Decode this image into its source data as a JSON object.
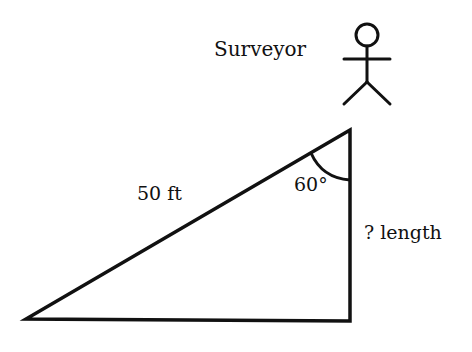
{
  "diagram": {
    "labels": {
      "surveyor": "Surveyor",
      "hypotenuse": "50 ft",
      "angle": "60°",
      "unknown_side": "? length"
    },
    "triangle": {
      "vertices": {
        "apex": [
          350,
          130
        ],
        "bottom_left": [
          26,
          319
        ],
        "bottom_right": [
          350,
          321
        ]
      },
      "hypotenuse_length": "50 ft",
      "apex_angle_deg": 60,
      "unknown": "vertical side"
    },
    "figure": "stick-figure surveyor",
    "colors": {
      "stroke": "#111111",
      "background": "#ffffff"
    }
  }
}
